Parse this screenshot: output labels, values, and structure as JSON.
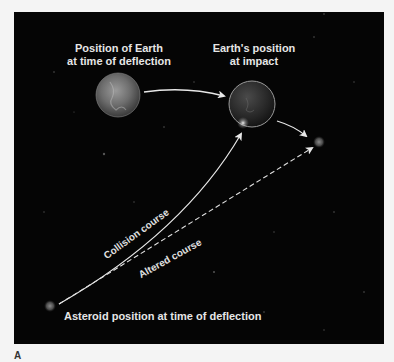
{
  "figure": {
    "panel_letter": "A",
    "labels": {
      "earth_deflection": [
        "Position of Earth",
        "at time of deflection"
      ],
      "earth_impact": [
        "Earth's position",
        "at impact"
      ],
      "collision_course": "Collision course",
      "altered_course": "Altered course",
      "asteroid_start": "Asteroid position at time of deflection"
    },
    "colors": {
      "background": "#050505",
      "page": "#f4f4f4",
      "line": "#e8e8e8",
      "text": "#e6e6e6"
    },
    "objects": [
      {
        "name": "earth-at-deflection",
        "cx": 104,
        "cy": 83,
        "r": 22
      },
      {
        "name": "earth-at-impact",
        "cx": 238,
        "cy": 92,
        "r": 23
      },
      {
        "name": "asteroid-at-deflection",
        "cx": 36,
        "cy": 294,
        "r": 5
      },
      {
        "name": "asteroid-altered-endpoint",
        "cx": 305,
        "cy": 130,
        "r": 5
      }
    ],
    "paths": [
      {
        "name": "earth-orbit-arrow",
        "style": "solid"
      },
      {
        "name": "collision-course",
        "style": "solid"
      },
      {
        "name": "altered-course",
        "style": "dashed"
      },
      {
        "name": "earth-continuation-arrow",
        "style": "solid"
      }
    ]
  }
}
